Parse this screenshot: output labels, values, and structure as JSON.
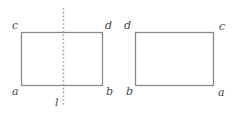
{
  "figure": {
    "background_color": "#ffffff",
    "stroke_color": "#8a8a8a",
    "label_color": "#4a4a4a",
    "mirror_line_color": "#9a9a9a",
    "left_shape": {
      "name": "rectangle",
      "corner_labels": {
        "top_left": "c",
        "top_right": "d",
        "bottom_left": "a",
        "bottom_right": "b"
      }
    },
    "right_shape": {
      "name": "rectangle",
      "corner_labels": {
        "top_left": "d",
        "top_right": "c",
        "bottom_left": "b",
        "bottom_right": "a"
      }
    },
    "mirror_line": {
      "label": "l",
      "style": "dotted-vertical"
    }
  }
}
